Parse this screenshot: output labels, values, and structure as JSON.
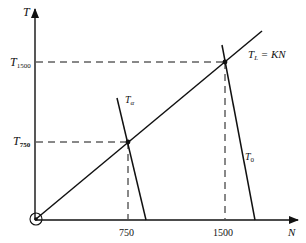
{
  "diagram": {
    "y_axis_label": "T",
    "x_axis_label": "N",
    "y_ticks": [
      {
        "main": "T",
        "sub": "1500"
      },
      {
        "main": "T",
        "sub": "750"
      }
    ],
    "x_ticks": [
      "750",
      "1500"
    ],
    "lines": {
      "load_line": {
        "main": "T",
        "sub": "L",
        "rest": " = KN"
      },
      "torque_alpha": {
        "main": "T",
        "sub": "α"
      },
      "torque_zero": {
        "main": "T",
        "sub": "0"
      }
    },
    "colors": {
      "ink": "#111111",
      "background": "#ffffff"
    }
  }
}
